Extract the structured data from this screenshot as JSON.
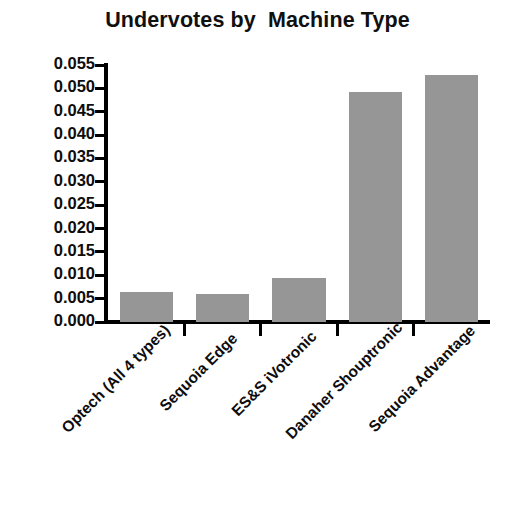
{
  "chart_data": {
    "type": "bar",
    "title": "Undervotes by  Machine Type",
    "xlabel": "",
    "ylabel": "",
    "categories": [
      "Optech (All 4 types)",
      "Sequoia Edge",
      "ES&S iVotronic",
      "Danaher Shouptronic",
      "Sequoia Advantage"
    ],
    "values": [
      0.0065,
      0.0059,
      0.0095,
      0.0492,
      0.0528
    ],
    "ylim": [
      0.0,
      0.055
    ],
    "yticks": [
      0.0,
      0.005,
      0.01,
      0.015,
      0.02,
      0.025,
      0.03,
      0.035,
      0.04,
      0.045,
      0.05,
      0.055
    ],
    "ytick_labels": [
      "0.000",
      "0.005",
      "0.010",
      "0.015",
      "0.020",
      "0.025",
      "0.030",
      "0.035",
      "0.040",
      "0.045",
      "0.050",
      "0.055"
    ],
    "grid": false,
    "legend": null,
    "bar_color": "#969696",
    "axis_color": "#000000",
    "background": "#ffffff",
    "xtick_label_rotation": -45
  }
}
